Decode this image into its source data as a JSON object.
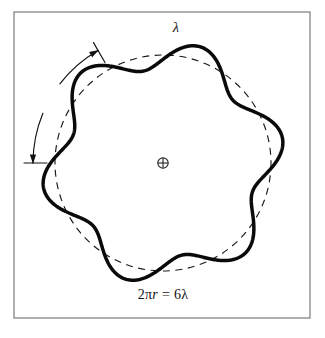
{
  "figure": {
    "kind": "physics-diagram",
    "background_color": "#ffffff",
    "ink_color": "#0a0a0a",
    "frame_color": "#6e6e6e"
  },
  "frame": {
    "name": "outer-border",
    "x": 14,
    "y": 12,
    "width": 296,
    "height": 306
  },
  "orbit": {
    "name": "dashed-reference-circle",
    "center_x": 163,
    "center_y": 163,
    "radius": 108,
    "style": "dashed",
    "color": "#1a1a1a"
  },
  "wave": {
    "name": "standing-wave-curve",
    "lobes": 6,
    "amplitude": 14,
    "phase_deg": 108,
    "color": "#0a0a0a",
    "stroke_width": 3.5
  },
  "center_mark": {
    "name": "nucleus-marker",
    "symbol": "circled-plus",
    "glyph": "⊕",
    "x": 163,
    "y": 163,
    "radius": 5.2
  },
  "wavelength_annotation": {
    "name": "wavelength-arc",
    "label": "λ",
    "arc_radius": 130,
    "start_angle_deg": 108,
    "end_angle_deg": 48,
    "arrow_ends": 2,
    "tick_marks": 2,
    "label_x": 176,
    "label_y": 27
  },
  "caption": {
    "name": "orbit-condition-caption",
    "prefix": "2π",
    "italic_symbol": "r",
    "relation": " = 6λ",
    "full_text": "2πr = 6λ",
    "x": 163,
    "y": 295
  },
  "colors": {
    "paper": "#ffffff",
    "ink": "#0a0a0a",
    "frame": "#6e6e6e",
    "dash": "#1a1a1a"
  }
}
